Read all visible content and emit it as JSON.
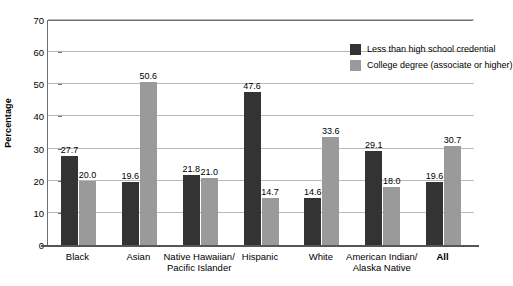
{
  "chart_data": {
    "type": "bar",
    "title": "",
    "xlabel": "",
    "ylabel": "Percentage",
    "ylim": [
      0,
      70
    ],
    "yticks": [
      0,
      10,
      20,
      30,
      40,
      50,
      60,
      70
    ],
    "grid": true,
    "legend_position": "top-right",
    "categories": [
      "Black",
      "Asian",
      "Native Hawaiian/\nPacific Islander",
      "Hispanic",
      "White",
      "American Indian/\nAlaska Native",
      "All"
    ],
    "category_lines": [
      [
        "Black"
      ],
      [
        "Asian"
      ],
      [
        "Native Hawaiian/",
        "Pacific Islander"
      ],
      [
        "Hispanic"
      ],
      [
        "White"
      ],
      [
        "American Indian/",
        "Alaska Native"
      ],
      [
        "All"
      ]
    ],
    "category_bold": [
      false,
      false,
      false,
      false,
      false,
      false,
      true
    ],
    "series": [
      {
        "name": "Less than high school credential",
        "color": "#333333",
        "values": [
          27.7,
          19.6,
          21.8,
          47.6,
          14.6,
          29.1,
          19.6
        ],
        "labels": [
          "27.7",
          "19.6",
          "21.8",
          "47.6",
          "14.6",
          "29.1",
          "19.6"
        ]
      },
      {
        "name": "College degree (associate or higher)",
        "color": "#9a9a9a",
        "values": [
          20.0,
          50.6,
          21.0,
          14.7,
          33.6,
          18.0,
          30.7
        ],
        "labels": [
          "20.0",
          "50.6",
          "21.0",
          "14.7",
          "33.6",
          "18.0",
          "30.7"
        ]
      }
    ],
    "ytick_labels": [
      "0",
      "10",
      "20",
      "30",
      "40",
      "50",
      "60",
      "70"
    ]
  },
  "legend": {
    "items": [
      {
        "label": "Less than high school credential",
        "color": "#333333"
      },
      {
        "label": "College degree (associate or higher)",
        "color": "#9a9a9a"
      }
    ]
  },
  "axis": {
    "y_title": "Percentage"
  }
}
